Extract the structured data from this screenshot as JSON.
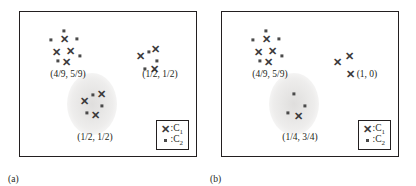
{
  "figure": {
    "type": "scatter",
    "panels": [
      {
        "caption": "(a)",
        "legend": {
          "rows": [
            {
              "symbol": "x-marker-icon",
              "text": "C",
              "sub": "1",
              "sep": ":"
            },
            {
              "symbol": "square-marker-icon",
              "text": "C",
              "sub": "2",
              "sep": ":"
            }
          ]
        },
        "labels": [
          {
            "name": "cluster-label-top-left",
            "text": "(4/9, 5/9)",
            "x": 48,
            "y": 62
          },
          {
            "name": "cluster-label-right",
            "text": "(1/2, 1/2)",
            "x": 140,
            "y": 62
          },
          {
            "name": "cluster-label-middle",
            "text": "(1/2, 1/2)",
            "x": 75,
            "y": 125
          }
        ],
        "ellipses": [
          {
            "name": "cluster-ellipse-middle",
            "cx": 72,
            "cy": 92,
            "rx": 25,
            "ry": 31
          }
        ],
        "points": [
          {
            "cls": "C2",
            "x": 44,
            "y": 19
          },
          {
            "cls": "C1",
            "x": 44,
            "y": 27
          },
          {
            "cls": "C2",
            "x": 31,
            "y": 28
          },
          {
            "cls": "C2",
            "x": 57,
            "y": 27
          },
          {
            "cls": "C1",
            "x": 36,
            "y": 40
          },
          {
            "cls": "C1",
            "x": 50,
            "y": 39
          },
          {
            "cls": "C2",
            "x": 60,
            "y": 44
          },
          {
            "cls": "C2",
            "x": 38,
            "y": 49
          },
          {
            "cls": "C1",
            "x": 46,
            "y": 50
          },
          {
            "cls": "C1",
            "x": 120,
            "y": 44
          },
          {
            "cls": "C2",
            "x": 129,
            "y": 40
          },
          {
            "cls": "C1",
            "x": 135,
            "y": 37
          },
          {
            "cls": "C2",
            "x": 137,
            "y": 49
          },
          {
            "cls": "C2",
            "x": 125,
            "y": 57
          },
          {
            "cls": "C1",
            "x": 134,
            "y": 57
          },
          {
            "cls": "C2",
            "x": 73,
            "y": 83
          },
          {
            "cls": "C1",
            "x": 81,
            "y": 82
          },
          {
            "cls": "C1",
            "x": 64,
            "y": 89
          },
          {
            "cls": "C2",
            "x": 82,
            "y": 94
          },
          {
            "cls": "C2",
            "x": 67,
            "y": 101
          },
          {
            "cls": "C1",
            "x": 75,
            "y": 103
          }
        ]
      },
      {
        "caption": "(b)",
        "legend": {
          "rows": [
            {
              "symbol": "x-marker-icon",
              "text": "C",
              "sub": "1",
              "sep": ":"
            },
            {
              "symbol": "square-marker-icon",
              "text": "C",
              "sub": "2",
              "sep": ":"
            }
          ]
        },
        "labels": [
          {
            "name": "cluster-label-top-left",
            "text": "(4/9, 5/9)",
            "x": 48,
            "y": 62
          },
          {
            "name": "cluster-label-right",
            "text": "(1, 0)",
            "x": 145,
            "y": 62
          },
          {
            "name": "cluster-label-middle",
            "text": "(1/4, 3/4)",
            "x": 78,
            "y": 125
          }
        ],
        "ellipses": [
          {
            "name": "cluster-ellipse-middle",
            "cx": 72,
            "cy": 92,
            "rx": 25,
            "ry": 31
          }
        ],
        "points": [
          {
            "cls": "C2",
            "x": 44,
            "y": 19
          },
          {
            "cls": "C1",
            "x": 44,
            "y": 27
          },
          {
            "cls": "C2",
            "x": 31,
            "y": 28
          },
          {
            "cls": "C2",
            "x": 57,
            "y": 27
          },
          {
            "cls": "C1",
            "x": 36,
            "y": 40
          },
          {
            "cls": "C1",
            "x": 50,
            "y": 39
          },
          {
            "cls": "C2",
            "x": 60,
            "y": 44
          },
          {
            "cls": "C2",
            "x": 38,
            "y": 49
          },
          {
            "cls": "C1",
            "x": 46,
            "y": 50
          },
          {
            "cls": "C1",
            "x": 115,
            "y": 50
          },
          {
            "cls": "C1",
            "x": 127,
            "y": 44
          },
          {
            "cls": "C1",
            "x": 128,
            "y": 62
          },
          {
            "cls": "C2",
            "x": 72,
            "y": 82
          },
          {
            "cls": "C2",
            "x": 83,
            "y": 94
          },
          {
            "cls": "C2",
            "x": 66,
            "y": 101
          },
          {
            "cls": "C1",
            "x": 76,
            "y": 104
          }
        ]
      }
    ]
  },
  "chart_data": {
    "type": "scatter",
    "title": "",
    "xlabel": "",
    "ylabel": "",
    "grid": false,
    "legend_position": "bottom-right",
    "series": [
      {
        "name": "C1",
        "marker": "x"
      },
      {
        "name": "C2",
        "marker": "square"
      }
    ],
    "panels": [
      {
        "caption": "(a)",
        "clusters": [
          {
            "label": "(4/9, 5/9)",
            "C1_count": 4,
            "C2_count": 5
          },
          {
            "label": "(1/2, 1/2)",
            "C1_count": 3,
            "C2_count": 3
          },
          {
            "label": "(1/2, 1/2)",
            "C1_count": 3,
            "C2_count": 3,
            "highlighted": true
          }
        ]
      },
      {
        "caption": "(b)",
        "clusters": [
          {
            "label": "(4/9, 5/9)",
            "C1_count": 4,
            "C2_count": 5
          },
          {
            "label": "(1, 0)",
            "C1_count": 3,
            "C2_count": 0
          },
          {
            "label": "(1/4, 3/4)",
            "C1_count": 1,
            "C2_count": 3,
            "highlighted": true
          }
        ]
      }
    ]
  }
}
